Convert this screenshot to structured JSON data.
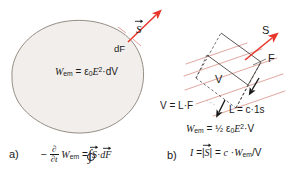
{
  "figure": {
    "background_color": "#ffffff",
    "ink_color": "#1a1a1a",
    "accent_color": "#e8362a",
    "grid_line_color": "#e0a79f",
    "blob_fill_color": "#f1eeec",
    "blob_stroke_color": "#8a8177"
  },
  "panel_a": {
    "letter": "a)",
    "vector_label": "S",
    "surface_element_label": "dF",
    "energy_density_equation": {
      "lhs": "W",
      "lhs_sub": "em",
      "eq": "=",
      "eps": "ε",
      "eps_sub": "0",
      "field": "E",
      "field_exp": "2",
      "dot_dv": "·dV",
      "full_text": "W_em = ε0E²·dV"
    },
    "poynting_theorem": {
      "minus": "−",
      "partial_num": "∂",
      "partial_den": "∂t",
      "w": "W",
      "w_sub": "em",
      "eq": "=",
      "integral": "∮",
      "s": "S",
      "dot": "·",
      "df": "dF",
      "full_text": "− ∂/∂t W_em = ∮ S→·dF→"
    }
  },
  "panel_b": {
    "letter": "b)",
    "vector_label": "S",
    "area_label": "F",
    "volume_label": "V",
    "volume_equation": "V = L·F",
    "length_equation": "L = c·1s",
    "energy_equation": {
      "lhs": "W",
      "lhs_sub": "em",
      "eq": "=",
      "half": "½",
      "eps": "ε",
      "eps_sub": "0",
      "field": "E",
      "field_exp": "2",
      "dot_v": "·V",
      "full_text": "W_em = ½ ε0E²·V"
    },
    "intensity_equation": {
      "i": "I",
      "eq1": "=",
      "bar_open": "|",
      "s": "S",
      "bar_close": "|",
      "eq2": "=",
      "c": "c",
      "dot": "·",
      "w": "W",
      "w_sub": "em",
      "over_v": "/V",
      "full_text": "I = |S→| = c·W_em/V"
    }
  }
}
